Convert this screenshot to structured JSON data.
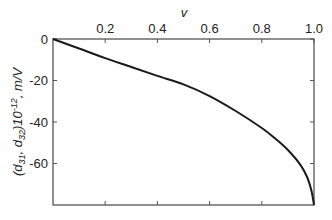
{
  "chart_data": {
    "type": "line",
    "title": "",
    "xlabel": "v",
    "ylabel": "(d31, d32)10^-12, m/V",
    "ylabel_parts": {
      "open": "(d",
      "sub1": "31",
      "sep": ", d",
      "sub2": "32",
      "close": ")10",
      "sup": "-12",
      "unit": ", m/V"
    },
    "xlim": [
      0,
      1.0
    ],
    "ylim": [
      -80,
      0
    ],
    "x_axis_position": "top",
    "xticks": [
      0.2,
      0.4,
      0.6,
      0.8,
      1.0
    ],
    "xtick_labels": [
      "0.2",
      "0.4",
      "0.6",
      "0.8",
      "1.0"
    ],
    "yticks": [
      0,
      -20,
      -40,
      -60
    ],
    "ytick_labels": [
      "0",
      "-20",
      "-40",
      "-60"
    ],
    "grid": false,
    "legend": null,
    "series": [
      {
        "name": "d31, d32",
        "color": "#1a1a1a",
        "x": [
          0.0,
          0.1,
          0.2,
          0.3,
          0.4,
          0.5,
          0.6,
          0.7,
          0.8,
          0.85,
          0.9,
          0.95,
          0.975,
          0.99,
          1.0
        ],
        "y": [
          0.0,
          -4.6,
          -9.2,
          -13.5,
          -17.8,
          -21.9,
          -27.5,
          -34.7,
          -42.9,
          -47.8,
          -53.5,
          -61.0,
          -67.0,
          -73.0,
          -80.0
        ]
      }
    ]
  }
}
